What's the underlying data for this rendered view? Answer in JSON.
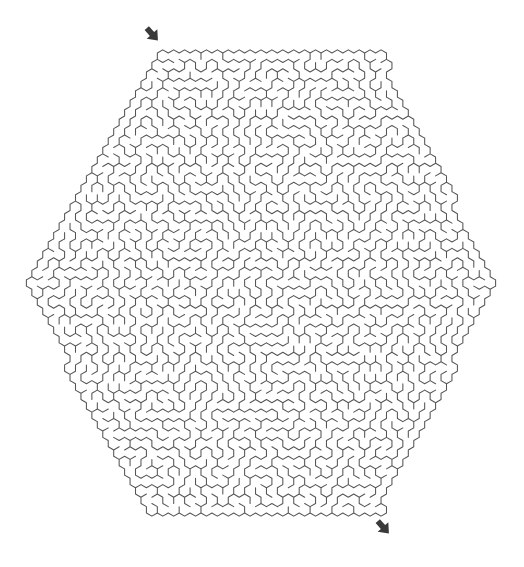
{
  "canvas": {
    "width": 524,
    "height": 567,
    "background_color": "#ffffff"
  },
  "maze": {
    "title": "Hexagonal Maze",
    "shape": "hexagon",
    "cell_shape": "hexagon",
    "orientation": "pointy-top-cells-in-flat-top-hexagon",
    "wall_color": "#555555",
    "wall_width": 1.05,
    "background_color": "#ffffff",
    "cell_radius": 6.3,
    "cell_pitch_x": 10.9,
    "cell_pitch_y": 9.45,
    "rings": 24,
    "outline_vertices": [
      [
        20,
        283
      ],
      [
        160,
        42
      ],
      [
        380,
        42
      ],
      [
        500,
        283
      ],
      [
        380,
        523
      ],
      [
        145,
        523
      ]
    ],
    "center": [
      261,
      283
    ],
    "seed": 20240617
  },
  "markers": {
    "entrance": {
      "label": "entrance-arrow",
      "x": 152,
      "y": 34,
      "rotation": 48,
      "color": "#3a3a3a",
      "size": 17
    },
    "exit": {
      "label": "exit-arrow",
      "x": 383,
      "y": 527,
      "rotation": 48,
      "color": "#3a3a3a",
      "size": 17
    }
  }
}
